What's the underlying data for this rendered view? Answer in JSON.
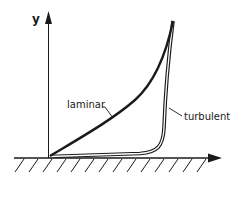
{
  "diagram": {
    "type": "velocity-profile",
    "axes": {
      "y_label": "y",
      "x_label": ""
    },
    "curves": [
      {
        "id": "laminar",
        "label": "laminar",
        "style": "thick-single"
      },
      {
        "id": "turbulent",
        "label": "turbulent",
        "style": "double-line"
      }
    ],
    "wall": {
      "hatched": true
    },
    "colors": {
      "ink": "#1a1a1a",
      "background": "#ffffff"
    }
  }
}
